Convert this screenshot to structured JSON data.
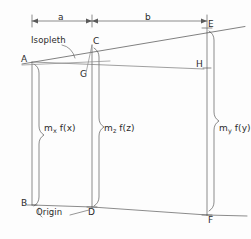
{
  "diagram": {
    "background_color": "#fdfdfd",
    "line_color": "#555555",
    "text_color": "#2b2b2b",
    "annotations": {
      "isopleth": "Isopleth",
      "origin": "Origin"
    },
    "dimensions": [
      {
        "id": "a",
        "label": "a",
        "from": "A",
        "to": "C"
      },
      {
        "id": "b",
        "label": "b",
        "from": "C",
        "to": "E"
      }
    ],
    "points": [
      {
        "id": "A",
        "label": "A",
        "x": 32,
        "y": 62
      },
      {
        "id": "B",
        "label": "B",
        "x": 32,
        "y": 205
      },
      {
        "id": "C",
        "label": "C",
        "x": 92,
        "y": 45
      },
      {
        "id": "D",
        "label": "D",
        "x": 92,
        "y": 207
      },
      {
        "id": "E",
        "label": "E",
        "x": 207,
        "y": 28
      },
      {
        "id": "F",
        "label": "F",
        "x": 207,
        "y": 215
      },
      {
        "id": "G",
        "label": "G",
        "x": 86,
        "y": 73
      },
      {
        "id": "H",
        "label": "H",
        "x": 199,
        "y": 68
      }
    ],
    "scales": [
      {
        "id": "x",
        "label_main": "m",
        "label_sub": "x",
        "label_tail": " f(x)",
        "text": "mxf(x)"
      },
      {
        "id": "z",
        "label_main": "m",
        "label_sub": "z",
        "label_tail": " f(z)",
        "text": "mzf(z)"
      },
      {
        "id": "y",
        "label_main": "m",
        "label_sub": "y",
        "label_tail": " f(y)",
        "text": "myf(y)"
      }
    ]
  }
}
